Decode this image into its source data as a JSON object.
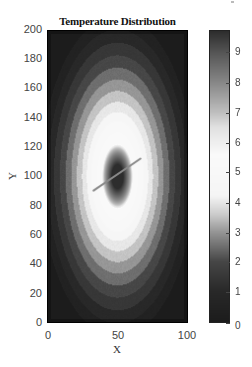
{
  "chart_data": {
    "type": "heatmap",
    "title": "Temperature Distribution",
    "xlabel": "X",
    "ylabel": "Y",
    "xlim": [
      0,
      100
    ],
    "ylim": [
      0,
      200
    ],
    "x_ticks": [
      0,
      50,
      100
    ],
    "y_ticks": [
      0,
      20,
      40,
      60,
      80,
      100,
      120,
      140,
      160,
      180,
      200
    ],
    "colorbar": {
      "ticks": [
        0,
        1,
        2,
        3,
        4,
        5,
        6,
        7,
        8,
        9
      ],
      "range": [
        0,
        9.7
      ],
      "colormap": "gray cyclic: dark at 0, light near 4.5-6, dark again near 9.7"
    },
    "field": {
      "description": "Concentric elliptical bands centered near (50, 100); darkest core with an inclined line segment at the center, bright white ring around core (~value 5), bands darkening outward toward the plot edges",
      "center": [
        50,
        100
      ],
      "core_blob_center": [
        49,
        103
      ],
      "line_segment": {
        "from": [
          33,
          90
        ],
        "to": [
          67,
          112
        ]
      },
      "grid": "off"
    },
    "legend": null
  },
  "title": "Temperature Distribution",
  "axes": {
    "xlabel": "X",
    "ylabel": "Y",
    "x_ticks": [
      "0",
      "50",
      "100"
    ],
    "y_ticks": [
      "0",
      "20",
      "40",
      "60",
      "80",
      "100",
      "120",
      "140",
      "160",
      "180",
      "200"
    ]
  },
  "colorbar": {
    "ticks": [
      "0",
      "1",
      "2",
      "3",
      "4",
      "5",
      "6",
      "7",
      "8",
      "9"
    ]
  }
}
